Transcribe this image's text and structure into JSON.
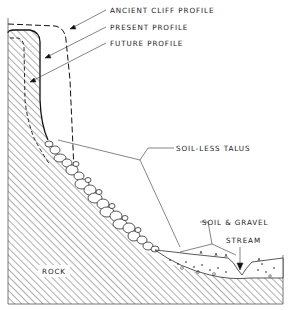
{
  "diagram": {
    "labels": {
      "ancient_cliff_profile": "ANCIENT CLIFF PROFILE",
      "present_profile": "PRESENT PROFILE",
      "future_profile": "FUTURE PROFILE",
      "soil_less_talus": "SOIL-LESS TALUS",
      "soil_and_gravel": "SOIL & GRAVEL",
      "stream": "STREAM",
      "rock": "ROCK"
    },
    "colors": {
      "ink": "#222222",
      "background": "#ffffff"
    }
  }
}
